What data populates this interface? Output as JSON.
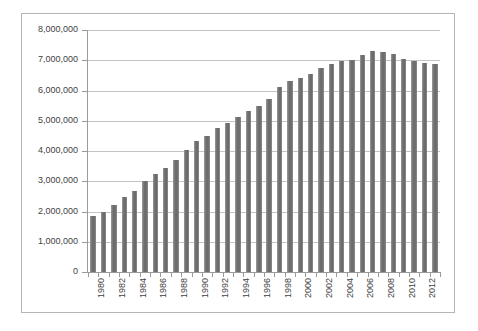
{
  "chart_data": {
    "type": "bar",
    "title": "",
    "subtitle": "",
    "xlabel": "",
    "ylabel": "",
    "ylim": [
      0,
      8000000
    ],
    "ytick_labels": [
      "8,000,000",
      "7,000,000",
      "6,000,000",
      "5,000,000",
      "4,000,000",
      "3,000,000",
      "2,000,000",
      "1,000,000",
      "0"
    ],
    "ytick_values": [
      8000000,
      7000000,
      6000000,
      5000000,
      4000000,
      3000000,
      2000000,
      1000000,
      0
    ],
    "grid": true,
    "legend": null,
    "legend_position": "none",
    "xtick_labels": [
      "1980",
      "1982",
      "1984",
      "1986",
      "1988",
      "1990",
      "1992",
      "1994",
      "1996",
      "1998",
      "2000",
      "2002",
      "2004",
      "2006",
      "2008",
      "2010",
      "2012"
    ],
    "categories": [
      "1980",
      "1981",
      "1982",
      "1983",
      "1984",
      "1985",
      "1986",
      "1987",
      "1988",
      "1989",
      "1990",
      "1991",
      "1992",
      "1993",
      "1994",
      "1995",
      "1996",
      "1997",
      "1998",
      "1999",
      "2000",
      "2001",
      "2002",
      "2003",
      "2004",
      "2005",
      "2006",
      "2007",
      "2008",
      "2009",
      "2010",
      "2011",
      "2012",
      "2013"
    ],
    "values": [
      1850000,
      2000000,
      2200000,
      2480000,
      2690000,
      3000000,
      3240000,
      3450000,
      3700000,
      4050000,
      4330000,
      4510000,
      4750000,
      4930000,
      5120000,
      5330000,
      5480000,
      5720000,
      6100000,
      6330000,
      6430000,
      6560000,
      6730000,
      6890000,
      6990000,
      7010000,
      7160000,
      7300000,
      7270000,
      7200000,
      7050000,
      6990000,
      6910000,
      6880000
    ],
    "series": [
      {
        "name": "series-1",
        "color": "#7a7a7a",
        "values": [
          1850000,
          2000000,
          2200000,
          2480000,
          2690000,
          3000000,
          3240000,
          3450000,
          3700000,
          4050000,
          4330000,
          4510000,
          4750000,
          4930000,
          5120000,
          5330000,
          5480000,
          5720000,
          6100000,
          6330000,
          6430000,
          6560000,
          6730000,
          6890000,
          6990000,
          7010000,
          7160000,
          7300000,
          7270000,
          7200000,
          7050000,
          6990000,
          6910000,
          6880000
        ]
      }
    ]
  },
  "style": {
    "bar_color": "#7a7a7a",
    "grid_color": "#c4c4c4",
    "axis_color": "#9a9a9a",
    "frame_color": "#b5b5b5",
    "text_color": "#3f3f3f",
    "background": "#ffffff"
  }
}
